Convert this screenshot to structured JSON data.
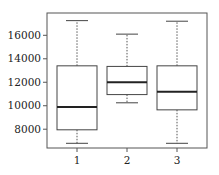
{
  "chart_data": {
    "type": "box",
    "title": "",
    "xlabel": "",
    "ylabel": "",
    "categories": [
      "1",
      "2",
      "3"
    ],
    "ylim": [
      6400,
      17900
    ],
    "yticks": [
      8000,
      10000,
      12000,
      14000,
      16000
    ],
    "ytick_labels": [
      "8000",
      "10000",
      "12000",
      "14000",
      "16000"
    ],
    "grid": false,
    "legend": null,
    "boxes": [
      {
        "label": "1",
        "whisker_low": 6800,
        "q1": 7950,
        "median": 9900,
        "q3": 13400,
        "whisker_high": 17250
      },
      {
        "label": "2",
        "whisker_low": 10250,
        "q1": 10950,
        "median": 12000,
        "q3": 13350,
        "whisker_high": 16100
      },
      {
        "label": "3",
        "whisker_low": 6800,
        "q1": 9650,
        "median": 11200,
        "q3": 13400,
        "whisker_high": 17200
      }
    ]
  },
  "colors": {
    "box_edge": "#444444",
    "median": "#222222",
    "whisker": "#555555",
    "frame": "#555555",
    "text": "#222222"
  }
}
